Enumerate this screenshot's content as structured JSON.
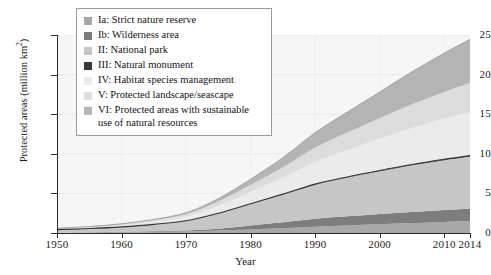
{
  "chart_data": {
    "type": "area",
    "stacked": true,
    "title": "",
    "xlabel": "Year",
    "ylabel": "Protected areas (million km²)",
    "xlim": [
      1950,
      2014
    ],
    "ylim": [
      0,
      25
    ],
    "xticks": [
      1950,
      1960,
      1970,
      1980,
      1990,
      2000,
      2010,
      2014
    ],
    "yticks": [
      0,
      5,
      10,
      15,
      20,
      25
    ],
    "grid": true,
    "legend_position": "top-left-inside",
    "x": [
      1950,
      1955,
      1960,
      1965,
      1970,
      1975,
      1980,
      1985,
      1990,
      1995,
      2000,
      2005,
      2010,
      2014
    ],
    "series": [
      {
        "name": "Ia: Strict nature reserve",
        "color": "#a8a8a8",
        "values": [
          0.05,
          0.07,
          0.1,
          0.14,
          0.2,
          0.3,
          0.45,
          0.6,
          0.8,
          0.95,
          1.1,
          1.25,
          1.4,
          1.5
        ]
      },
      {
        "name": "Ib: Wilderness area",
        "color": "#7d7d7d",
        "values": [
          0.02,
          0.03,
          0.05,
          0.08,
          0.12,
          0.25,
          0.5,
          0.75,
          1.0,
          1.15,
          1.3,
          1.4,
          1.5,
          1.55
        ]
      },
      {
        "name": "II: National park",
        "color": "#c6c6c6",
        "values": [
          0.35,
          0.45,
          0.6,
          0.85,
          1.2,
          1.9,
          2.7,
          3.5,
          4.3,
          4.9,
          5.4,
          5.9,
          6.3,
          6.6
        ]
      },
      {
        "name": "III: Natural monument",
        "color": "#3a3a3a",
        "values": [
          0.01,
          0.01,
          0.02,
          0.02,
          0.03,
          0.04,
          0.05,
          0.06,
          0.07,
          0.08,
          0.09,
          0.1,
          0.11,
          0.12
        ]
      },
      {
        "name": "IV: Habitat species management",
        "color": "#ebebeb",
        "values": [
          0.1,
          0.15,
          0.22,
          0.35,
          0.55,
          0.95,
          1.5,
          2.1,
          2.8,
          3.4,
          4.0,
          4.6,
          5.1,
          5.5
        ]
      },
      {
        "name": "V: Protected landscape/seascape",
        "color": "#dcdcdc",
        "values": [
          0.05,
          0.08,
          0.12,
          0.2,
          0.3,
          0.55,
          0.9,
          1.3,
          1.8,
          2.2,
          2.6,
          3.0,
          3.4,
          3.7
        ]
      },
      {
        "name": "VI: Protected areas with sustainable use of natural resources",
        "color": "#b4b4b4",
        "values": [
          0.02,
          0.03,
          0.05,
          0.08,
          0.15,
          0.35,
          0.7,
          1.2,
          1.9,
          2.6,
          3.3,
          4.1,
          4.9,
          5.5
        ]
      }
    ],
    "totals": [
      0.6,
      0.82,
      1.16,
      1.72,
      2.55,
      4.34,
      6.8,
      9.51,
      12.67,
      15.28,
      17.79,
      20.35,
      22.71,
      24.47
    ]
  },
  "axes": {
    "y_title_main": "Protected areas (million km",
    "y_title_sup": "2",
    "y_title_close": ")",
    "x_title": "Year",
    "y_tick_labels": [
      "25",
      "20",
      "15",
      "10",
      "5",
      "0"
    ],
    "x_tick_labels": [
      "1950",
      "1960",
      "1970",
      "1980",
      "1990",
      "2000",
      "2010",
      "2014"
    ]
  },
  "legend": {
    "items": [
      {
        "label": "Ia: Strict nature reserve",
        "color": "#a8a8a8"
      },
      {
        "label": "Ib: Wilderness area",
        "color": "#7d7d7d"
      },
      {
        "label": "II: National park",
        "color": "#c6c6c6"
      },
      {
        "label": "III: Natural monument",
        "color": "#3a3a3a"
      },
      {
        "label": "IV: Habitat species management",
        "color": "#ebebeb"
      },
      {
        "label": "V: Protected landscape/seascape",
        "color": "#dcdcdc"
      },
      {
        "label": "VI: Protected areas with sustainable\nuse of natural resources",
        "color": "#b4b4b4"
      }
    ]
  }
}
